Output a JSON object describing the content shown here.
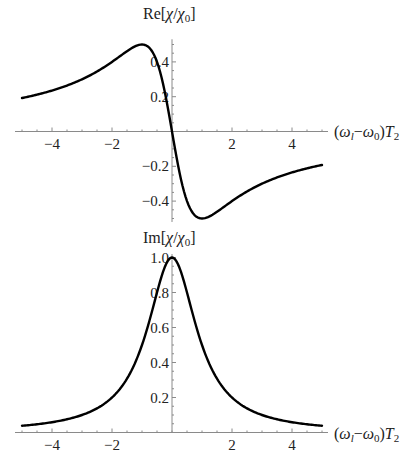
{
  "chart_data": [
    {
      "type": "line",
      "title": "",
      "ylabel": "Re[χ/χ0]",
      "xlabel": "(ωl−ω0)T2",
      "xlim": [
        -5,
        5
      ],
      "ylim": [
        -0.52,
        0.53
      ],
      "x_ticks": [
        -4,
        -2,
        2,
        4
      ],
      "y_ticks": [
        -0.4,
        -0.2,
        0.2,
        0.4
      ],
      "y_tick_labels": [
        "−0.4",
        "−0.2",
        "0.2",
        "0.4"
      ],
      "x_tick_labels": [
        "−4",
        "−2",
        "2",
        "4"
      ],
      "function": "-x/(1+x^2)",
      "series": [
        {
          "name": "Re[χ/χ0]",
          "x": [
            -5,
            -4,
            -3,
            -2,
            -1.5,
            -1,
            -0.5,
            0,
            0.5,
            1,
            1.5,
            2,
            3,
            4,
            5
          ],
          "values": [
            0.192,
            0.235,
            0.3,
            0.4,
            0.462,
            0.5,
            0.4,
            0.0,
            -0.4,
            -0.5,
            -0.462,
            -0.4,
            -0.3,
            -0.235,
            -0.192
          ]
        }
      ],
      "grid": false
    },
    {
      "type": "line",
      "title": "",
      "ylabel": "Im[χ/χ0]",
      "xlabel": "(ωl−ω0)T2",
      "xlim": [
        -5,
        5
      ],
      "ylim": [
        0,
        1.02
      ],
      "x_ticks": [
        -4,
        -2,
        2,
        4
      ],
      "y_ticks": [
        0.2,
        0.4,
        0.6,
        0.8,
        1.0
      ],
      "y_tick_labels": [
        "0.2",
        "0.4",
        "0.6",
        "0.8",
        "1.0"
      ],
      "x_tick_labels": [
        "−4",
        "−2",
        "2",
        "4"
      ],
      "function": "1/(1+x^2)",
      "series": [
        {
          "name": "Im[χ/χ0]",
          "x": [
            -5,
            -4,
            -3,
            -2,
            -1.5,
            -1,
            -0.5,
            0,
            0.5,
            1,
            1.5,
            2,
            3,
            4,
            5
          ],
          "values": [
            0.038,
            0.059,
            0.1,
            0.2,
            0.308,
            0.5,
            0.8,
            1.0,
            0.8,
            0.5,
            0.308,
            0.2,
            0.1,
            0.059,
            0.038
          ]
        }
      ],
      "grid": false
    }
  ],
  "labels": {
    "top_ylabel_prefix": "Re[",
    "chi": "χ",
    "slash": "/",
    "chi0_base": "χ",
    "chi0_sub": "0",
    "ylabel_suffix": "]",
    "bottom_ylabel_prefix": "Im[",
    "xlabel_open": "(",
    "omega": "ω",
    "sub_l": "l",
    "minus": "−",
    "sub_0": "0",
    "xlabel_close": ")",
    "T": "T",
    "sub_2": "2"
  },
  "colors": {
    "curve": "#000000",
    "axis": "#8a8a8a",
    "text": "#222222"
  }
}
